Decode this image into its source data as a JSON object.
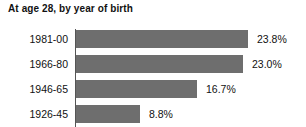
{
  "chart_data": {
    "type": "bar",
    "orientation": "horizontal",
    "title": "At age 28, by year of birth",
    "xlabel": "",
    "ylabel": "",
    "categories": [
      "1981-00",
      "1966-80",
      "1946-65",
      "1926-45"
    ],
    "values": [
      23.8,
      23.0,
      16.7,
      8.8
    ],
    "value_labels": [
      "23.8%",
      "23.0%",
      "16.7%",
      "8.8%"
    ],
    "xlim": [
      0,
      23.8
    ],
    "grid": false,
    "legend": "none",
    "bar_color": "#6e6e6e",
    "axis_color": "#555555",
    "background": "#ffffff",
    "px_per_unit": 7.24,
    "bars": [
      {
        "category": "1981-00",
        "value": 23.8,
        "label": "23.8%",
        "length_px": 172,
        "top_px": 1
      },
      {
        "category": "1966-80",
        "value": 23.0,
        "label": "23.0%",
        "length_px": 167,
        "top_px": 26
      },
      {
        "category": "1946-65",
        "value": 16.7,
        "label": "16.7%",
        "length_px": 121,
        "top_px": 51
      },
      {
        "category": "1926-45",
        "value": 8.8,
        "label": "8.8%",
        "length_px": 64,
        "top_px": 76
      }
    ]
  }
}
